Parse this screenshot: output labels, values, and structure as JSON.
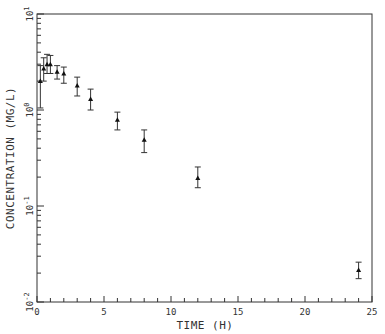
{
  "chart_data": {
    "type": "scatter",
    "title": "",
    "xlabel": "TIME (H)",
    "ylabel": "CONCENTRATION (MG/L)",
    "xlim": [
      0,
      25
    ],
    "ylim": [
      0.01,
      10
    ],
    "yscale": "log",
    "grid": false,
    "x_ticks": [
      0,
      5,
      10,
      15,
      20,
      25
    ],
    "y_ticks": [
      "10^-2",
      "10^-1",
      "10^0",
      "10^1"
    ],
    "series": [
      {
        "name": "observed",
        "marker": "triangle",
        "x": [
          0.25,
          0.5,
          0.75,
          1,
          1.5,
          2,
          3,
          4,
          6,
          8,
          12,
          24
        ],
        "y": [
          2.0,
          2.7,
          3.0,
          3.0,
          2.5,
          2.4,
          1.8,
          1.3,
          0.79,
          0.49,
          0.196,
          0.0216
        ],
        "err_low": [
          1.05,
          2.0,
          2.4,
          2.4,
          2.1,
          1.9,
          1.4,
          1.0,
          0.62,
          0.36,
          0.155,
          0.0175
        ],
        "err_high": [
          2.9,
          3.5,
          3.8,
          3.7,
          2.9,
          2.8,
          2.2,
          1.65,
          0.95,
          0.62,
          0.255,
          0.026
        ]
      }
    ]
  },
  "axes": {
    "x_label": "TIME (H)",
    "y_label": "CONCENTRATION (MG/L)",
    "x_tick_labels": [
      "0",
      "5",
      "10",
      "15",
      "20",
      "25"
    ],
    "y_tick_labels": [
      {
        "base": "10",
        "exp": "-2"
      },
      {
        "base": "10",
        "exp": "-1"
      },
      {
        "base": "10",
        "exp": "0"
      },
      {
        "base": "10",
        "exp": "1"
      }
    ]
  },
  "colors": {
    "axis": "#333333",
    "marker": "#111111",
    "background": "#ffffff"
  }
}
